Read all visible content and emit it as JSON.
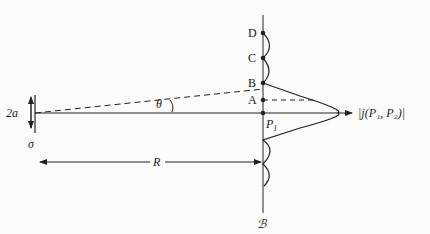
{
  "diagram": {
    "points": [
      {
        "id": "D",
        "label": "D"
      },
      {
        "id": "C",
        "label": "C"
      },
      {
        "id": "B",
        "label": "B"
      },
      {
        "id": "A",
        "label": "A"
      }
    ],
    "p1": {
      "main": "P",
      "sub": "1"
    },
    "axis_label": "|j(P₁, P₂)|",
    "angle_label": "θ",
    "aperture_label": "2a",
    "source_label": "σ",
    "distance_label": "R",
    "screen_label": "ℬ",
    "colors": {
      "line": "#222222",
      "background": "#fbfbf9"
    }
  }
}
